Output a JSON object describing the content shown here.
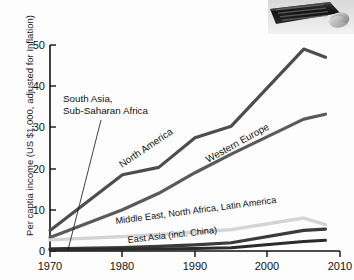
{
  "figure": {
    "photo_caption": "keyboard-and-mouse-photo"
  },
  "chart_data": {
    "type": "line",
    "title": "",
    "xlabel": "",
    "ylabel": "Per captia income (US $1,000, adjusted for Inflation)",
    "xlim": [
      1970,
      2010
    ],
    "ylim": [
      0,
      50
    ],
    "xticks": [
      "1970",
      "1980",
      "1990",
      "2000",
      "2010"
    ],
    "yticks": [
      "0",
      "10",
      "20",
      "30",
      "40",
      "50"
    ],
    "grid": false,
    "legend_position": "inline-annotations",
    "x": [
      1970,
      1980,
      1985,
      1990,
      1995,
      2005,
      2008
    ],
    "series": [
      {
        "name": "North America",
        "color": "#4d4d4d",
        "values": [
          5.0,
          18.5,
          20.3,
          27.5,
          30.3,
          49.0,
          47.0
        ]
      },
      {
        "name": "Western Europe",
        "color": "#5a5a5a",
        "values": [
          3.3,
          10.0,
          14.0,
          19.0,
          23.5,
          32.0,
          33.2
        ]
      },
      {
        "name": "Middle East, North Africa, Latin America",
        "color": "#d4d4d4",
        "values": [
          2.7,
          3.5,
          4.0,
          4.6,
          5.2,
          8.0,
          6.4
        ]
      },
      {
        "name": "East Asia (incl. China)",
        "color": "#3a3a3a",
        "values": [
          0.5,
          0.8,
          1.1,
          1.5,
          2.0,
          5.0,
          5.3
        ]
      },
      {
        "name": "South Asia, Sub-Saharan Africa",
        "color": "#2b2b2b",
        "values": [
          0.3,
          0.4,
          0.5,
          0.6,
          0.8,
          2.3,
          2.6
        ]
      }
    ],
    "annotations": [
      {
        "id": "south-asia",
        "text_line1": "South Asia,",
        "text_line2": "Sub-Saharan Africa"
      },
      {
        "id": "north-america",
        "text": "North America"
      },
      {
        "id": "western-europe",
        "text": "Western Europe"
      },
      {
        "id": "middle-east",
        "text": "Middle East, North Africa, Latin America"
      },
      {
        "id": "east-asia",
        "text": "East Asia (incl. China)"
      }
    ]
  }
}
